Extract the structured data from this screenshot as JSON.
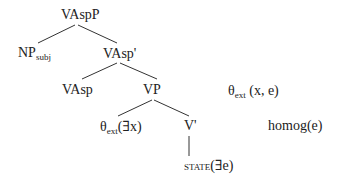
{
  "diagram": {
    "type": "syntax-tree",
    "nodes": {
      "root": {
        "label": "VAspP"
      },
      "np_subj": {
        "label": "NP",
        "subscript": "subj"
      },
      "vasp_bar": {
        "label": "VAsp'"
      },
      "vasp": {
        "label": "VAsp"
      },
      "vp": {
        "label": "VP"
      },
      "theta_x": {
        "label": "θ",
        "subscript": "ext",
        "suffix": "(∃x)"
      },
      "v_bar": {
        "label": "V'"
      },
      "state": {
        "label": "state",
        "suffix": "(∃e)"
      }
    },
    "annotations": {
      "theta_xe": {
        "label": "θ",
        "subscript": "ext",
        "suffix": " (x, e)"
      },
      "homog": {
        "label": "homog(e)"
      }
    },
    "edges": [
      [
        "root",
        "np_subj"
      ],
      [
        "root",
        "vasp_bar"
      ],
      [
        "vasp_bar",
        "vasp"
      ],
      [
        "vasp_bar",
        "vp"
      ],
      [
        "vp",
        "theta_x"
      ],
      [
        "vp",
        "v_bar"
      ],
      [
        "v_bar",
        "state"
      ]
    ],
    "colors": {
      "ink": "#222222",
      "background": "#ffffff"
    }
  }
}
